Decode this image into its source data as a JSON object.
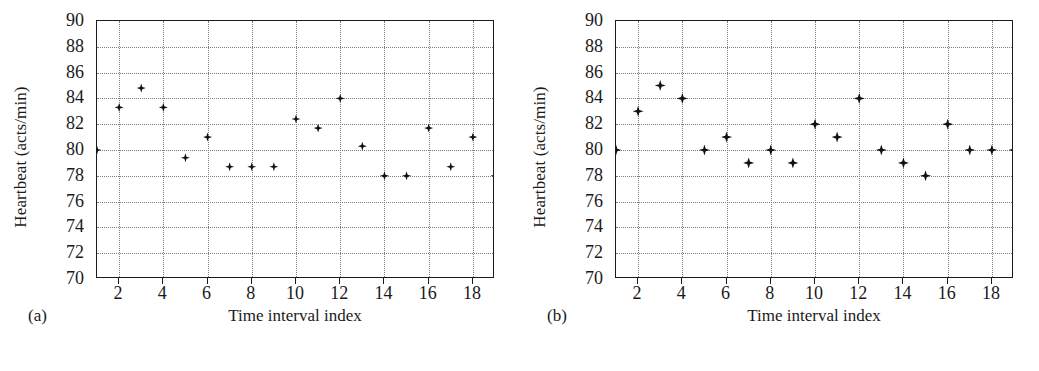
{
  "figure": {
    "panels": [
      {
        "letter": "(a)",
        "ylabel": "Heartbeat (acts/min)",
        "xlabel": "Time interval index"
      },
      {
        "letter": "(b)",
        "ylabel": "Heartbeat (acts/min)",
        "xlabel": "Time interval index"
      }
    ]
  },
  "axes": {
    "y_ticks": [
      70,
      72,
      74,
      76,
      78,
      80,
      82,
      84,
      86,
      88,
      90
    ],
    "x_ticks": [
      2,
      4,
      6,
      8,
      10,
      12,
      14,
      16,
      18
    ],
    "y_min": 70,
    "y_max": 90,
    "x_min": 1,
    "x_max": 19,
    "grid": true,
    "marker_color": "#121212",
    "grid_color": "#7c7c7c",
    "frame_color": "#1b1b1b"
  },
  "chart_data": [
    {
      "type": "scatter",
      "panel": "(a)",
      "title": "",
      "xlabel": "Time interval index",
      "ylabel": "Heartbeat (acts/min)",
      "xlim": [
        1,
        19
      ],
      "ylim": [
        70,
        90
      ],
      "grid": true,
      "legend": "none",
      "x": [
        1,
        2,
        3,
        4,
        5,
        6,
        7,
        8,
        9,
        10,
        11,
        12,
        13,
        14,
        15,
        16,
        17,
        18,
        19
      ],
      "y": [
        80.0,
        83.3,
        84.8,
        83.3,
        79.4,
        81.0,
        78.7,
        78.7,
        78.7,
        82.4,
        81.7,
        84.0,
        80.3,
        78.0,
        78.0,
        81.7,
        78.7,
        81.0,
        78.0
      ]
    },
    {
      "type": "scatter",
      "panel": "(b)",
      "title": "",
      "xlabel": "Time interval index",
      "ylabel": "Heartbeat (acts/min)",
      "xlim": [
        1,
        19
      ],
      "ylim": [
        70,
        90
      ],
      "grid": true,
      "legend": "none",
      "x": [
        1,
        2,
        3,
        4,
        5,
        6,
        7,
        8,
        9,
        10,
        11,
        12,
        13,
        14,
        15,
        16,
        17,
        18,
        19
      ],
      "y": [
        80,
        83,
        85,
        84,
        80,
        81,
        79,
        80,
        79,
        82,
        81,
        84,
        80,
        79,
        78,
        82,
        80,
        80,
        80
      ]
    }
  ]
}
